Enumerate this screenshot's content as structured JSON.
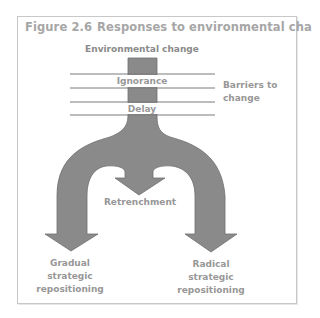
{
  "figure": {
    "number": "Figure 2.6",
    "title": "Responses to environmental change"
  },
  "diagram": {
    "input_label": "Environmental change",
    "barriers": [
      {
        "label": "Ignorance"
      },
      {
        "label": "Delay"
      }
    ],
    "barriers_label_line1": "Barriers to",
    "barriers_label_line2": "change",
    "outcomes": [
      {
        "id": "gradual",
        "line1": "Gradual",
        "line2": "strategic",
        "line3": "repositioning"
      },
      {
        "id": "retrenchment",
        "line1": "Retrenchment"
      },
      {
        "id": "radical",
        "line1": "Radical",
        "line2": "strategic",
        "line3": "repositioning"
      }
    ],
    "colors": {
      "shape_fill": "#8a8a8a",
      "shape_stroke": "#6f6f6f",
      "barrier_line": "#7a7a7a",
      "text": "#979797",
      "title_text": "#a6a6a6",
      "frame_border": "#c8c8c8"
    }
  }
}
